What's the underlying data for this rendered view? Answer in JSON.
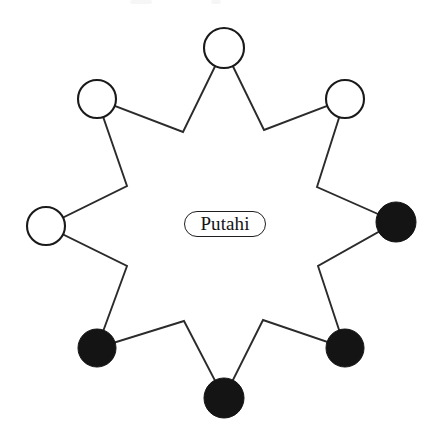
{
  "figure": {
    "type": "node-link-diagram",
    "background_color": "#ffffff",
    "width": 440,
    "height": 439,
    "center_label": {
      "text": "Putahi",
      "shape": "rounded-pill",
      "x": 184,
      "y": 211,
      "width": 82,
      "height": 26,
      "border_color": "#1f1f1f",
      "fill_color": "#ffffff",
      "text_color": "#141414"
    },
    "legend": {
      "open_circle_meaning": "unfilled node",
      "filled_circle_meaning": "filled node"
    },
    "colors": {
      "stroke": "#2b2b2b",
      "node_outline": "#1a1a1a",
      "node_fill_black": "#141414",
      "node_fill_white": "#ffffff"
    },
    "nodes": [
      {
        "id": "n1",
        "label": "",
        "position": "top",
        "cx": 224,
        "cy": 48,
        "r": 20,
        "fill": "open"
      },
      {
        "id": "n2",
        "label": "",
        "position": "top-right",
        "cx": 345,
        "cy": 99,
        "r": 19,
        "fill": "open"
      },
      {
        "id": "n3",
        "label": "",
        "position": "right",
        "cx": 396,
        "cy": 222,
        "r": 20,
        "fill": "filled"
      },
      {
        "id": "n4",
        "label": "",
        "position": "bottom-right",
        "cx": 345,
        "cy": 348,
        "r": 19,
        "fill": "filled"
      },
      {
        "id": "n5",
        "label": "",
        "position": "bottom",
        "cx": 224,
        "cy": 398,
        "r": 20,
        "fill": "filled"
      },
      {
        "id": "n6",
        "label": "",
        "position": "bottom-left",
        "cx": 97,
        "cy": 348,
        "r": 19,
        "fill": "filled"
      },
      {
        "id": "n7",
        "label": "",
        "position": "left",
        "cx": 46,
        "cy": 226,
        "r": 19,
        "fill": "open"
      },
      {
        "id": "n8",
        "label": "",
        "position": "top-left",
        "cx": 97,
        "cy": 99,
        "r": 19,
        "fill": "open"
      }
    ],
    "inner_vertices": [
      {
        "id": "i1",
        "x": 264,
        "y": 130
      },
      {
        "id": "i2",
        "x": 317,
        "y": 187
      },
      {
        "id": "i3",
        "x": 318,
        "y": 266
      },
      {
        "id": "i4",
        "x": 263,
        "y": 320
      },
      {
        "id": "i5",
        "x": 184,
        "y": 321
      },
      {
        "id": "i6",
        "x": 127,
        "y": 266
      },
      {
        "id": "i7",
        "x": 127,
        "y": 186
      },
      {
        "id": "i8",
        "x": 183,
        "y": 132
      }
    ],
    "star_path_points": "224,48 264,130 345,99 317,187 396,222 318,266 345,348 263,320 224,398 184,321 97,348 127,266 46,226 127,186 97,99 183,132 224,48",
    "node_counts": {
      "open": 4,
      "filled": 4,
      "total": 8
    },
    "artifacts": [
      {
        "id": "a1",
        "x": 130,
        "y": 0,
        "width": 22,
        "height": 5
      },
      {
        "id": "a2",
        "x": 211,
        "y": 0,
        "width": 10,
        "height": 5
      },
      {
        "id": "a3",
        "x": 204,
        "y": 24,
        "width": 22,
        "height": 4
      }
    ]
  }
}
